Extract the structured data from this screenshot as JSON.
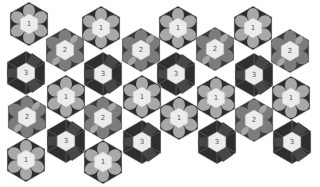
{
  "colors": {
    "background": "#ffffff",
    "outer_dark": "#2e2e2e",
    "outer_mid": "#4a4a4a",
    "petal_light": "#a8a8a8",
    "petal_mid": "#7c7c7c",
    "center": "#ececec",
    "edge_line": "#d8d8d8"
  },
  "tiles": [
    {
      "label": "1",
      "x": 29,
      "y": 24
    },
    {
      "label": "1",
      "x": 101,
      "y": 28
    },
    {
      "label": "1",
      "x": 178,
      "y": 28
    },
    {
      "label": "1",
      "x": 253,
      "y": 28
    },
    {
      "label": "2",
      "x": 65,
      "y": 50
    },
    {
      "label": "2",
      "x": 141,
      "y": 50
    },
    {
      "label": "2",
      "x": 215,
      "y": 49
    },
    {
      "label": "2",
      "x": 290,
      "y": 51
    },
    {
      "label": "3",
      "x": 26,
      "y": 73
    },
    {
      "label": "3",
      "x": 103,
      "y": 74
    },
    {
      "label": "3",
      "x": 176,
      "y": 74
    },
    {
      "label": "3",
      "x": 254,
      "y": 75
    },
    {
      "label": "1",
      "x": 66,
      "y": 97
    },
    {
      "label": "1",
      "x": 142,
      "y": 97
    },
    {
      "label": "1",
      "x": 216,
      "y": 98
    },
    {
      "label": "1",
      "x": 291,
      "y": 98
    },
    {
      "label": "2",
      "x": 27,
      "y": 117
    },
    {
      "label": "2",
      "x": 103,
      "y": 118
    },
    {
      "label": "1",
      "x": 179,
      "y": 118
    },
    {
      "label": "2",
      "x": 254,
      "y": 120
    },
    {
      "label": "3",
      "x": 66,
      "y": 141
    },
    {
      "label": "3",
      "x": 142,
      "y": 142
    },
    {
      "label": "3",
      "x": 217,
      "y": 142
    },
    {
      "label": "3",
      "x": 292,
      "y": 142
    },
    {
      "label": "1",
      "x": 26,
      "y": 160
    },
    {
      "label": "1",
      "x": 103,
      "y": 162
    }
  ]
}
